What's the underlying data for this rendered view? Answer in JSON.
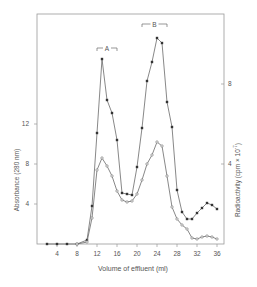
{
  "chart_data": {
    "type": "line",
    "title": "",
    "xlabel": "Volume of effluent (ml)",
    "ylabel_left": "Absorbance (280 nm)",
    "ylabel_right": "Radioactivity (cpm x 10^-7)",
    "ylabel_right_parts": {
      "base": "Radioactivity  (cpm × 10",
      "exp": "-7",
      "close": ")"
    },
    "xlim": [
      0,
      37
    ],
    "ylim_left": [
      0,
      20
    ],
    "ylim_right": [
      0,
      10
    ],
    "x_ticks": [
      4,
      8,
      12,
      16,
      20,
      24,
      28,
      32,
      36
    ],
    "y_ticks_left": [
      4,
      8,
      12
    ],
    "y_ticks_right": [
      4,
      8
    ],
    "grid": false,
    "annotations": [
      {
        "label": "A",
        "x_start": 12,
        "x_end": 16,
        "y_left": 19.6
      },
      {
        "label": "B",
        "x_start": 21,
        "x_end": 26,
        "y_left": 22.0
      }
    ],
    "series": [
      {
        "name": "Absorbance (280 nm)",
        "axis": "left",
        "marker": "filled",
        "x": [
          2,
          4,
          6,
          8,
          10,
          11,
          12,
          13,
          14,
          15,
          16,
          17,
          18,
          19,
          20,
          21,
          22,
          23,
          24,
          25,
          26,
          27,
          28,
          29,
          30,
          31,
          32,
          33,
          34,
          35,
          36
        ],
        "values": [
          0,
          0,
          0,
          0,
          0.4,
          3.8,
          11.1,
          18.5,
          14.4,
          13.1,
          10.4,
          5.1,
          5.0,
          4.9,
          7.7,
          11.6,
          16.3,
          18.2,
          20.6,
          20.1,
          14.2,
          11.7,
          5.4,
          3.2,
          2.5,
          2.5,
          3.1,
          3.6,
          4.1,
          3.9,
          3.5
        ]
      },
      {
        "name": "Radioactivity (cpm x 10^-7)",
        "axis": "right",
        "marker": "open",
        "x": [
          8,
          10,
          11,
          12,
          13,
          14,
          15,
          16,
          17,
          18,
          19,
          20,
          21,
          22,
          23,
          24,
          25,
          26,
          27,
          28,
          29,
          30,
          31,
          32,
          33,
          34,
          35,
          36
        ],
        "values": [
          0,
          0.1,
          1.3,
          3.7,
          4.3,
          3.9,
          3.4,
          2.65,
          2.2,
          2.1,
          2.15,
          2.5,
          3.2,
          4.0,
          4.45,
          5.1,
          4.9,
          3.4,
          1.85,
          1.25,
          0.95,
          0.75,
          0.3,
          0.25,
          0.35,
          0.4,
          0.35,
          0.25
        ]
      }
    ]
  },
  "colors": {
    "line": "#6a6a6a",
    "marker_filled": "#333333",
    "axis": "#9a9a9a",
    "text": "#555555"
  }
}
